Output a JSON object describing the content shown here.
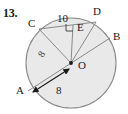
{
  "problem": {
    "number": "13."
  },
  "figure": {
    "type": "circle-geometry-diagram",
    "colors": {
      "fill": "#e9e9e9",
      "stroke": "#8a8a8a",
      "text": "#1a1a1a"
    },
    "circle": {
      "center_label": "O",
      "center_px": {
        "x": 71,
        "y": 63
      },
      "radius_px": 45
    },
    "point_labels": [
      {
        "name": "A",
        "text": "A",
        "x": 16,
        "y": 94
      },
      {
        "name": "B",
        "text": "B",
        "x": 113,
        "y": 40
      },
      {
        "name": "C",
        "text": "C",
        "x": 28,
        "y": 27
      },
      {
        "name": "D",
        "text": "D",
        "x": 93,
        "y": 15
      },
      {
        "name": "E",
        "text": "E",
        "x": 77,
        "y": 31
      },
      {
        "name": "O",
        "text": "O",
        "x": 78,
        "y": 69
      }
    ],
    "measure_labels": [
      {
        "name": "chord-CE-length",
        "text": "10",
        "x": 57,
        "y": 22
      },
      {
        "name": "radius-AO-length",
        "text": "8",
        "x": 56,
        "y": 94
      },
      {
        "name": "segment-CO-length",
        "text": "8",
        "x": 43,
        "y": 58
      }
    ],
    "marks": [
      {
        "name": "right-angle-at-E",
        "text": "",
        "kind": "right-angle-square"
      },
      {
        "name": "double-arrow-AO",
        "text": "",
        "kind": "double-headed-arrow"
      },
      {
        "name": "center-dot-O",
        "text": "",
        "kind": "dot"
      }
    ],
    "segments": [
      {
        "name": "diameter-AB",
        "from": "A",
        "to": "B"
      },
      {
        "name": "chord-CD",
        "from": "C",
        "to": "D"
      },
      {
        "name": "radius-CO",
        "from": "C",
        "to": "O"
      },
      {
        "name": "segment-EO",
        "from": "E",
        "to": "O"
      },
      {
        "name": "radius-DO",
        "from": "D",
        "to": "O"
      }
    ]
  }
}
